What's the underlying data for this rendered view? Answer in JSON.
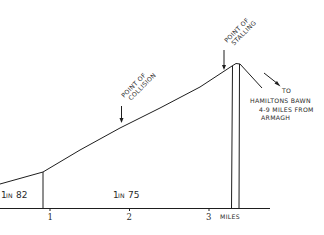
{
  "diagram": {
    "type": "gradient-profile",
    "annotations": {
      "collision": [
        "POINT OF",
        "COLLISION"
      ],
      "stalling": [
        "POINT OF",
        "STALLING"
      ],
      "destination": {
        "line1": "TO",
        "line2": "HAMILTONS BAWN",
        "line3": "4-9 MILES FROM",
        "line4": "ARMAGH"
      }
    },
    "gradients": [
      {
        "label_num_a": "1",
        "label_in": "IN",
        "label_num_b": "82"
      },
      {
        "label_num_a": "1",
        "label_in": "IN",
        "label_num_b": "75"
      }
    ],
    "axis": {
      "ticks": [
        "1",
        "2",
        "3"
      ],
      "unit": "MILES"
    },
    "colors": {
      "ink": "#1e1e1e",
      "background": "#ffffff"
    }
  }
}
